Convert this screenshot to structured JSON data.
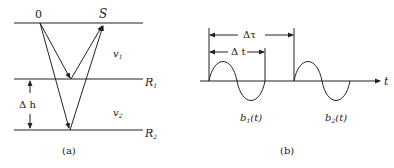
{
  "panel_a": {
    "source_label": "0",
    "receiver_label": "S",
    "velocity_1": "v",
    "velocity_1_sub": "1",
    "velocity_2": "v",
    "velocity_2_sub": "2",
    "reflector_1": "R",
    "reflector_1_sub": "1",
    "reflector_2": "R",
    "reflector_2_sub": "2",
    "thickness_label": "Δ h",
    "caption": "(a)"
  },
  "panel_b": {
    "delta_tau_label": "Δτ",
    "delta_t_label": "Δ t",
    "axis_label": "t",
    "wavelet_1": "b",
    "wavelet_1_sub": "1",
    "wavelet_1_arg": "(t)",
    "wavelet_2": "b",
    "wavelet_2_sub": "2",
    "wavelet_2_arg": "(t)",
    "caption": "(b)"
  },
  "colors": {
    "line": "#222222",
    "background": "#ffffff"
  }
}
